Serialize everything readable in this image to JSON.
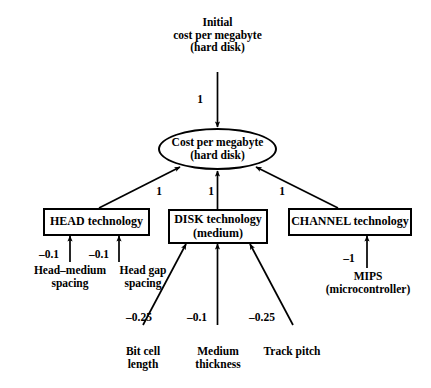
{
  "diagram": {
    "title_node": {
      "id": "initial-cost-per-megabyte",
      "text": "Initial\ncost per megabyte\n(hard disk)"
    },
    "center_node": {
      "id": "cost-per-megabyte",
      "text": "Cost per megabyte\n(hard disk)"
    },
    "boxes": [
      {
        "id": "head-technology",
        "text": "HEAD technology"
      },
      {
        "id": "disk-technology",
        "text": "DISK technology\n(medium)"
      },
      {
        "id": "channel-technology",
        "text": "CHANNEL technology"
      }
    ],
    "leaf_nodes": [
      {
        "id": "head-medium-spacing",
        "text": "Head–medium\nspacing"
      },
      {
        "id": "head-gap-spacing",
        "text": "Head gap\nspacing"
      },
      {
        "id": "bit-cell-length",
        "text": "Bit cell\nlength"
      },
      {
        "id": "medium-thickness",
        "text": "Medium\nthickness"
      },
      {
        "id": "track-pitch",
        "text": "Track pitch"
      },
      {
        "id": "mips-microcontroller",
        "text": "MIPS\n(microcontroller)"
      }
    ],
    "weights": {
      "initial_to_center": "1",
      "head_to_center": "1",
      "disk_to_center": "1",
      "channel_to_center": "1",
      "head_medium_spacing": "–0.1",
      "head_gap_spacing": "–0.1",
      "bit_cell_length": "–0.25",
      "medium_thickness": "–0.1",
      "track_pitch": "–0.25",
      "mips": "–1"
    },
    "colors": {
      "stroke": "#000000",
      "background": "#ffffff",
      "text": "#000000"
    }
  }
}
